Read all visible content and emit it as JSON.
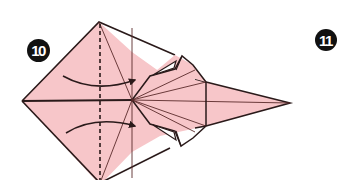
{
  "diagram": {
    "type": "origami-instruction",
    "steps": {
      "current": {
        "label": "10"
      },
      "next": {
        "label": "11"
      }
    },
    "colors": {
      "paper": "#f7c6c9",
      "line": "#2a1a1a",
      "crease": "#5a2a2a",
      "badge": "#111111",
      "badge_text": "#ffffff",
      "pocket": "#ffffff"
    },
    "annotations": {
      "fold_type": "valley-fold",
      "arrows": [
        {
          "direction": "right",
          "position": "upper"
        },
        {
          "direction": "right",
          "position": "lower"
        }
      ]
    }
  }
}
